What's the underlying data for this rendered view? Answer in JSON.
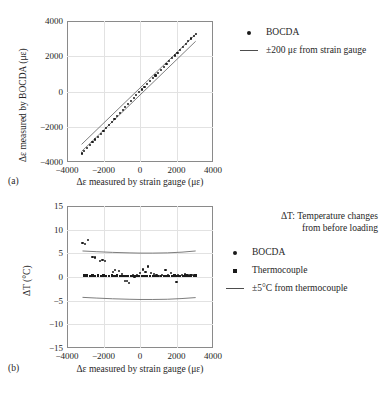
{
  "figure": {
    "background": "#ffffff",
    "ink": "#262626",
    "marker_color": "#1a1a1a",
    "band_color": "#6e6e6e",
    "grid_color": "#e2e2e2",
    "frame_color": "#8a8a8a"
  },
  "panel_a": {
    "sublabel": "(a)",
    "legend": {
      "items": [
        {
          "key": "dot",
          "label": "BOCDA"
        },
        {
          "key": "line",
          "label": "±200 με from strain gauge"
        }
      ]
    }
  },
  "panel_b": {
    "sublabel": "(b)",
    "legend": {
      "note": [
        "ΔT: Temperature changes",
        "from before loading"
      ],
      "items": [
        {
          "key": "dot",
          "label": "BOCDA"
        },
        {
          "key": "square",
          "label": "Thermocouple"
        },
        {
          "key": "line",
          "label": "±5°C from thermocouple"
        }
      ]
    }
  },
  "chart_data": [
    {
      "id": "panel-a",
      "type": "scatter",
      "title": "",
      "xlabel": "Δε measured by strain gauge (με)",
      "ylabel": "Δε measured by BOCDA (με)",
      "xlim": [
        -4000,
        4000
      ],
      "ylim": [
        -4000,
        4000
      ],
      "xticks": [
        -4000,
        -2000,
        0,
        2000,
        4000
      ],
      "xticklabels": [
        "-4000",
        "-2000",
        "0",
        "2000",
        "4000"
      ],
      "yticks": [
        -4000,
        -2000,
        0,
        2000,
        4000
      ],
      "yticklabels": [
        "-4000",
        "-2000",
        "0",
        "2000",
        "4000"
      ],
      "grid": true,
      "legend_position": "right",
      "series": [
        {
          "name": "BOCDA",
          "marker": "dot",
          "x": [
            -3200,
            -3050,
            -2900,
            -2750,
            -2600,
            -2450,
            -2300,
            -2150,
            -2000,
            -1850,
            -1700,
            -1550,
            -1400,
            -1250,
            -1100,
            -950,
            -800,
            -650,
            -500,
            -350,
            -200,
            -50,
            100,
            250,
            400,
            550,
            700,
            850,
            1000,
            1150,
            1300,
            1450,
            1600,
            1750,
            1900,
            2050,
            2200,
            2350,
            2500,
            2650,
            2800,
            2950,
            3050
          ],
          "y": [
            -3520,
            -3360,
            -3200,
            -3040,
            -2880,
            -2720,
            -2560,
            -2400,
            -2230,
            -2070,
            -1900,
            -1730,
            -1560,
            -1400,
            -1230,
            -1060,
            -890,
            -720,
            -550,
            -380,
            -215,
            -50,
            110,
            270,
            430,
            590,
            750,
            910,
            1070,
            1230,
            1390,
            1550,
            1720,
            1880,
            2040,
            2200,
            2360,
            2520,
            2690,
            2850,
            3010,
            3170,
            3270
          ]
        }
      ],
      "bands": [
        {
          "name": "+200 με from strain gauge",
          "x": [
            -3200,
            3050
          ],
          "y": [
            -3000,
            3250
          ]
        },
        {
          "name": "-200 με from strain gauge",
          "x": [
            -3200,
            3050
          ],
          "y": [
            -3400,
            2850
          ]
        }
      ]
    },
    {
      "id": "panel-b",
      "type": "scatter",
      "title": "",
      "xlabel": "Δε measured by strain gauge (με)",
      "ylabel": "ΔT (°C)",
      "xlim": [
        -4000,
        4000
      ],
      "ylim": [
        -15,
        15
      ],
      "xticks": [
        -4000,
        -2000,
        0,
        2000,
        4000
      ],
      "xticklabels": [
        "-4000",
        "-2000",
        "0",
        "2000",
        "4000"
      ],
      "yticks": [
        -15,
        -10,
        -5,
        0,
        5,
        10,
        15
      ],
      "yticklabels": [
        "-15",
        "-10",
        "-5",
        "0",
        "5",
        "10",
        "15"
      ],
      "grid": true,
      "legend_position": "right",
      "series": [
        {
          "name": "BOCDA",
          "marker": "dot",
          "x": [
            -3150,
            -3000,
            -2850,
            -2600,
            -2450,
            -2200,
            -2050,
            -1900,
            -1500,
            -1350,
            -1150,
            -1000,
            -800,
            -700,
            -600,
            -500,
            -400,
            -300,
            -150,
            0,
            150,
            300,
            450,
            600,
            750,
            900,
            1050,
            1200,
            1400,
            1550,
            1700,
            1850,
            2000,
            2100,
            2300,
            2450,
            2600,
            2750,
            2850,
            2950,
            3050
          ],
          "y": [
            7.2,
            7.0,
            7.8,
            4.2,
            4.1,
            3.3,
            3.6,
            3.4,
            1.0,
            1.5,
            1.2,
            0.6,
            -0.8,
            -0.9,
            -1.2,
            0.2,
            0.5,
            0.1,
            0.4,
            0.8,
            1.6,
            1.1,
            2.2,
            0.9,
            0.6,
            0.3,
            0.2,
            0.5,
            1.5,
            0.4,
            0.9,
            0.3,
            -1.0,
            0.4,
            0.5,
            0.6,
            0.3,
            0.4,
            0.5,
            0.3,
            0.4
          ]
        },
        {
          "name": "Thermocouple",
          "marker": "square",
          "x": [
            -3050,
            -2900,
            -2750,
            -2600,
            -2450,
            -2300,
            -2150,
            -2000,
            -1850,
            -1700,
            -1550,
            -1400,
            -1250,
            -1100,
            -950,
            -800,
            -650,
            -500,
            -350,
            -200,
            -50,
            100,
            250,
            400,
            550,
            700,
            850,
            1000,
            1150,
            1300,
            1450,
            1600,
            1750,
            1900,
            2050,
            2200,
            2350,
            2500,
            2650,
            2800,
            2950,
            3050
          ],
          "y": [
            0.3,
            0.3,
            0.25,
            0.3,
            0.25,
            0.3,
            0.25,
            0.3,
            0.2,
            0.25,
            0.3,
            0.2,
            0.3,
            0.25,
            0.2,
            0.25,
            0.15,
            0.2,
            0.25,
            0.15,
            0.2,
            0.25,
            0.2,
            0.15,
            0.2,
            0.25,
            0.15,
            0.2,
            0.25,
            0.2,
            0.15,
            0.25,
            0.2,
            0.3,
            0.2,
            0.25,
            0.2,
            0.3,
            0.25,
            0.3,
            0.25,
            0.3
          ]
        }
      ],
      "bands": [
        {
          "name": "+5°C from thermocouple",
          "x": [
            -3150,
            -2400,
            -1500,
            -600,
            0,
            700,
            1500,
            2300,
            3050
          ],
          "y": [
            5.5,
            5.35,
            5.2,
            5.1,
            5.05,
            5.05,
            5.1,
            5.25,
            5.5
          ]
        },
        {
          "name": "-5°C from thermocouple",
          "x": [
            -3150,
            -2400,
            -1500,
            -600,
            0,
            700,
            1500,
            2300,
            3050
          ],
          "y": [
            -4.3,
            -4.45,
            -4.6,
            -4.7,
            -4.75,
            -4.75,
            -4.7,
            -4.55,
            -4.35
          ]
        }
      ]
    }
  ]
}
